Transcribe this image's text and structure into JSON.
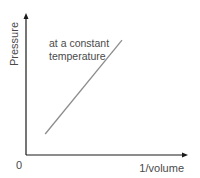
{
  "chart_data": {
    "type": "line",
    "title": "",
    "xlabel": "1/volume",
    "ylabel": "Pressure",
    "origin_label": "0",
    "annotation": [
      "at a constant",
      "temperature"
    ],
    "xlim": [
      0,
      1
    ],
    "ylim": [
      0,
      1
    ],
    "grid": false,
    "legend": "none",
    "series": [
      {
        "name": "at a constant temperature",
        "x": [
          0.12,
          0.6
        ],
        "y": [
          0.15,
          0.82
        ]
      }
    ]
  },
  "colors": {
    "axis": "#1a1a1a",
    "line": "#8c8c8c",
    "text": "#4a4a4a"
  }
}
